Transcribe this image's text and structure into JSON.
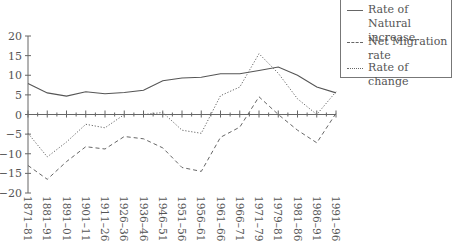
{
  "chart_data": {
    "type": "line",
    "title": "",
    "xlabel": "",
    "ylabel": "",
    "ylim": [
      -20,
      20
    ],
    "yticks": [
      20,
      15,
      10,
      5,
      0,
      -5,
      -10,
      -15,
      -20
    ],
    "grid": false,
    "legend_position": "top-right",
    "categories": [
      "1871–81",
      "1881–91",
      "1891–01",
      "1901–11",
      "1911–26",
      "1926–36",
      "1936–46",
      "1946–51",
      "1951–56",
      "1956–61",
      "1961–66",
      "1966–71",
      "1971–79",
      "1979–81",
      "1981–86",
      "1986–91",
      "1991–96"
    ],
    "series": [
      {
        "name": "Rate of Natural increase",
        "style": "solid",
        "values": [
          7.9,
          5.5,
          4.7,
          5.8,
          5.3,
          5.6,
          6.2,
          8.6,
          9.3,
          9.5,
          10.4,
          10.4,
          11.2,
          12.1,
          10.0,
          7.0,
          5.5
        ]
      },
      {
        "name": "Net Migration rate",
        "style": "dashed",
        "values": [
          -13.0,
          -16.5,
          -12.0,
          -8.2,
          -8.8,
          -5.6,
          -6.2,
          -8.5,
          -13.5,
          -14.5,
          -5.8,
          -3.2,
          4.5,
          0.0,
          -4.0,
          -7.2,
          0.3
        ]
      },
      {
        "name": "Rate of change",
        "style": "dotted",
        "values": [
          -4.8,
          -10.8,
          -7.0,
          -2.5,
          -3.4,
          0.0,
          0.0,
          0.5,
          -4.0,
          -4.8,
          4.8,
          7.0,
          15.5,
          10.5,
          4.0,
          0.0,
          5.8
        ]
      }
    ]
  },
  "legend": {
    "items": [
      {
        "label": "Rate of Natural increase"
      },
      {
        "label": "Net Migration rate"
      },
      {
        "label": "Rate of change"
      }
    ]
  }
}
